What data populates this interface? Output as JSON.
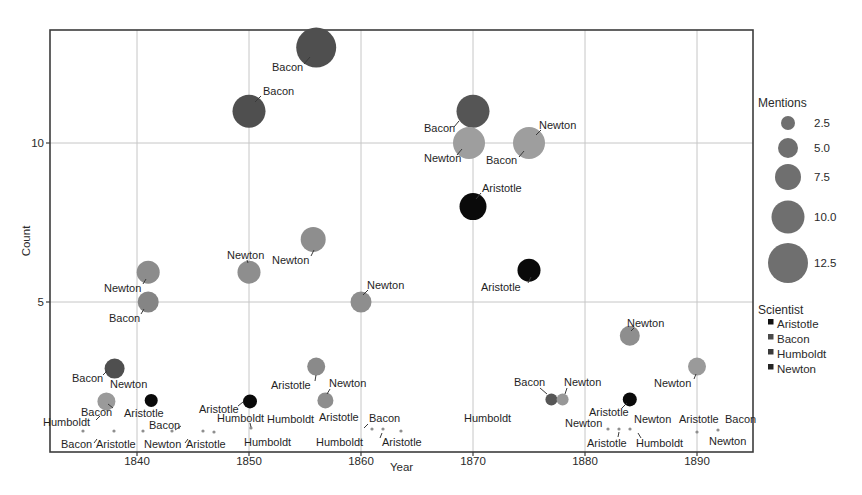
{
  "figure": {
    "width": 862,
    "height": 495,
    "background": "#ffffff"
  },
  "chart_data": {
    "type": "scatter",
    "subtype": "bubble",
    "title": "",
    "xlabel": "Year",
    "ylabel": "Count",
    "x_ticks": [
      1840,
      1850,
      1860,
      1870,
      1880,
      1890
    ],
    "y_ticks": [
      5,
      10
    ],
    "xlim": [
      1832,
      1895
    ],
    "ylim": [
      0.3,
      13.6
    ],
    "grid": true,
    "panel": {
      "left": 50,
      "top": 30,
      "right": 753,
      "bottom": 452,
      "border_color": "#3c3c3c",
      "grid_color": "#c6c6c6",
      "bg": "#ffffff"
    },
    "x_scale": {
      "year0": 1840,
      "x0": 137,
      "px_per_year": 11.2
    },
    "y_scale": {
      "count0": 5,
      "y0": 302,
      "px_per_count": 31.8
    },
    "text_color": "#2a2a2a",
    "leader_color": "#3a3a3a",
    "speck_color": "#8f8f8f",
    "points": [
      {
        "year": 1856,
        "count": 13,
        "mentions": 13,
        "scientist": "Bacon",
        "color": "#4f4f4f",
        "r": 20
      },
      {
        "year": 1850,
        "count": 11,
        "mentions": 11,
        "scientist": "Bacon",
        "color": "#4f4f4f",
        "r": 16.5
      },
      {
        "year": 1870,
        "count": 11,
        "mentions": 11,
        "scientist": "Bacon",
        "color": "#555555",
        "r": 16.5
      },
      {
        "year": 1870,
        "count": 10,
        "mentions": 10,
        "scientist": "Newton",
        "color": "#9e9e9e",
        "r": 16,
        "dx": -4
      },
      {
        "year": 1875,
        "count": 10,
        "mentions": 10,
        "scientist": "Bacon",
        "color": "#9e9e9e",
        "r": 16
      },
      {
        "year": 1870,
        "count": 8,
        "mentions": 8,
        "scientist": "Aristotle",
        "color": "#0a0a0a",
        "r": 13.5
      },
      {
        "year": 1875,
        "count": 6,
        "mentions": 6,
        "scientist": "Aristotle",
        "color": "#0a0a0a",
        "r": 11.5
      },
      {
        "year": 1856,
        "count": 7,
        "mentions": 7,
        "scientist": "Newton",
        "color": "#8e8e8e",
        "r": 12.5,
        "dx": -3,
        "dy": 1
      },
      {
        "year": 1850,
        "count": 6,
        "mentions": 6,
        "scientist": "Newton",
        "color": "#8e8e8e",
        "r": 11.5,
        "dy": 2
      },
      {
        "year": 1841,
        "count": 6,
        "mentions": 6,
        "scientist": "Newton",
        "color": "#8c8c8c",
        "r": 11.5,
        "dy": 2
      },
      {
        "year": 1841,
        "count": 5,
        "mentions": 5,
        "scientist": "Bacon",
        "color": "#858585",
        "r": 10.5
      },
      {
        "year": 1860,
        "count": 5,
        "mentions": 5,
        "scientist": "Newton",
        "color": "#8e8e8e",
        "r": 10.5
      },
      {
        "year": 1884,
        "count": 4,
        "mentions": 4,
        "scientist": "Newton",
        "color": "#8e8e8e",
        "r": 10,
        "dy": 2
      },
      {
        "year": 1890,
        "count": 3,
        "mentions": 3,
        "scientist": "Newton",
        "color": "#9a9a9a",
        "r": 9,
        "dy": 1
      },
      {
        "year": 1856,
        "count": 3,
        "mentions": 3,
        "scientist": "Aristotle",
        "color": "#8a8a8a",
        "r": 9,
        "dy": 1
      },
      {
        "year": 1838,
        "count": 3,
        "mentions": 3,
        "scientist": "Bacon",
        "color": "#4f4f4f",
        "r": 10,
        "dy": 3
      },
      {
        "year": 1837,
        "count": 2,
        "mentions": 2,
        "scientist": "Newton",
        "color": "#9a9a9a",
        "r": 9,
        "dx": 3,
        "dy": 4
      },
      {
        "year": 1857,
        "count": 2,
        "mentions": 2,
        "scientist": "Newton",
        "color": "#8e8e8e",
        "r": 8,
        "dx": -2,
        "dy": 3
      },
      {
        "year": 1841,
        "count": 2,
        "mentions": 2,
        "scientist": "Aristotle",
        "color": "#0a0a0a",
        "r": 6.5,
        "dx": 3,
        "dy": 3
      },
      {
        "year": 1850,
        "count": 2,
        "mentions": 2,
        "scientist": "Aristotle",
        "color": "#0a0a0a",
        "r": 7,
        "dx": 1,
        "dy": 4
      },
      {
        "year": 1877,
        "count": 2,
        "mentions": 2,
        "scientist": "Bacon",
        "color": "#565656",
        "r": 6,
        "dy": 2
      },
      {
        "year": 1878,
        "count": 2,
        "mentions": 2,
        "scientist": "Newton",
        "color": "#989898",
        "r": 6,
        "dy": 2
      },
      {
        "year": 1884,
        "count": 2,
        "mentions": 2,
        "scientist": "Aristotle",
        "color": "#0a0a0a",
        "r": 7,
        "dy": 2
      }
    ],
    "specks": [
      {
        "x": 83,
        "y": 431
      },
      {
        "x": 114,
        "y": 431
      },
      {
        "x": 143,
        "y": 431
      },
      {
        "x": 172,
        "y": 431
      },
      {
        "x": 203,
        "y": 431
      },
      {
        "x": 214,
        "y": 432
      },
      {
        "x": 251,
        "y": 428
      },
      {
        "x": 372,
        "y": 429
      },
      {
        "x": 383,
        "y": 429
      },
      {
        "x": 401,
        "y": 431
      },
      {
        "x": 608,
        "y": 429
      },
      {
        "x": 619,
        "y": 429
      },
      {
        "x": 630,
        "y": 429
      },
      {
        "x": 697,
        "y": 432
      },
      {
        "x": 718,
        "y": 430
      }
    ],
    "labels": [
      {
        "text": "Bacon",
        "x": 272,
        "y": 71,
        "leader": [
          304,
          64,
          310,
          57
        ]
      },
      {
        "text": "Bacon",
        "x": 263,
        "y": 95,
        "leader": [
          261,
          96,
          255,
          102
        ]
      },
      {
        "text": "Bacon",
        "x": 424,
        "y": 132,
        "leader": [
          454,
          127,
          459,
          121
        ]
      },
      {
        "text": "Newton",
        "x": 424,
        "y": 162,
        "leader": [
          457,
          155,
          462,
          149
        ]
      },
      {
        "text": "Newton",
        "x": 539,
        "y": 129,
        "leader": [
          541,
          130,
          536,
          135
        ]
      },
      {
        "text": "Bacon",
        "x": 486,
        "y": 164,
        "leader": [
          519,
          157,
          524,
          151
        ]
      },
      {
        "text": "Aristotle",
        "x": 482,
        "y": 192,
        "leader": [
          481,
          193,
          476,
          199
        ]
      },
      {
        "text": "Aristotle",
        "x": 481,
        "y": 291,
        "leader": [
          528,
          283,
          531,
          277
        ]
      },
      {
        "text": "Newton",
        "x": 272,
        "y": 264,
        "leader": [
          311,
          256,
          314,
          250
        ]
      },
      {
        "text": "Newton",
        "x": 227,
        "y": 259,
        "leader": [
          247,
          260,
          248,
          263
        ]
      },
      {
        "text": "Newton",
        "x": 104,
        "y": 292,
        "leader": [
          143,
          284,
          146,
          279
        ]
      },
      {
        "text": "Bacon",
        "x": 109,
        "y": 322,
        "leader": [
          141,
          314,
          144,
          309
        ]
      },
      {
        "text": "Newton",
        "x": 367,
        "y": 289,
        "leader": [
          368,
          290,
          363,
          295
        ]
      },
      {
        "text": "Newton",
        "x": 627,
        "y": 327,
        "leader": [
          634,
          328,
          631,
          331
        ]
      },
      {
        "text": "Newton",
        "x": 654,
        "y": 387,
        "leader": [
          694,
          379,
          696,
          374
        ]
      },
      {
        "text": "Aristotle",
        "x": 271,
        "y": 389,
        "leader": [
          315,
          381,
          316,
          375
        ]
      },
      {
        "text": "Newton",
        "x": 329,
        "y": 387,
        "leader": [
          330,
          389,
          327,
          394
        ]
      },
      {
        "text": "Bacon",
        "x": 72,
        "y": 382,
        "leader": [
          103,
          375,
          107,
          371
        ]
      },
      {
        "text": "Newton",
        "x": 110,
        "y": 388
      },
      {
        "text": "Bacon",
        "x": 81,
        "y": 416,
        "leader": [
          113,
          408,
          108,
          404
        ]
      },
      {
        "text": "Aristotle",
        "x": 124,
        "y": 417
      },
      {
        "text": "Humboldt",
        "x": 43,
        "y": 426,
        "leader": [
          96,
          420,
          100,
          416
        ]
      },
      {
        "text": "Bacon",
        "x": 149,
        "y": 429,
        "leader": [
          181,
          426,
          175,
          430
        ]
      },
      {
        "text": "Aristotle",
        "x": 199,
        "y": 413,
        "leader": [
          238,
          406,
          243,
          402
        ]
      },
      {
        "text": "Humboldt",
        "x": 217,
        "y": 422,
        "leader": [
          250,
          423,
          251,
          427
        ]
      },
      {
        "text": "Humboldt",
        "x": 267,
        "y": 423
      },
      {
        "text": "Bacon",
        "x": 61,
        "y": 448,
        "leader": [
          94,
          443,
          97,
          439
        ]
      },
      {
        "text": "Aristotle",
        "x": 96,
        "y": 448
      },
      {
        "text": "Newton",
        "x": 144,
        "y": 448,
        "leader": [
          185,
          443,
          188,
          439
        ]
      },
      {
        "text": "Aristotle",
        "x": 186,
        "y": 448
      },
      {
        "text": "Humboldt",
        "x": 244,
        "y": 446
      },
      {
        "text": "Humboldt",
        "x": 316,
        "y": 446
      },
      {
        "text": "Aristotle",
        "x": 382,
        "y": 446,
        "leader": [
          380,
          438,
          382,
          433
        ]
      },
      {
        "text": "Aristotle",
        "x": 319,
        "y": 421
      },
      {
        "text": "Bacon",
        "x": 369,
        "y": 422,
        "leader": [
          368,
          424,
          364,
          428
        ]
      },
      {
        "text": "Humboldt",
        "x": 464,
        "y": 422
      },
      {
        "text": "Bacon",
        "x": 514,
        "y": 386,
        "leader": [
          540,
          388,
          547,
          394
        ]
      },
      {
        "text": "Newton",
        "x": 564,
        "y": 386,
        "leader": [
          567,
          388,
          565,
          394
        ]
      },
      {
        "text": "Aristotle",
        "x": 589,
        "y": 416,
        "leader": [
          622,
          408,
          627,
          403
        ]
      },
      {
        "text": "Newton",
        "x": 565,
        "y": 427
      },
      {
        "text": "Newton",
        "x": 634,
        "y": 423
      },
      {
        "text": "Aristotle",
        "x": 679,
        "y": 423
      },
      {
        "text": "Bacon",
        "x": 725,
        "y": 423
      },
      {
        "text": "Aristotle",
        "x": 587,
        "y": 447,
        "leader": [
          618,
          437,
          619,
          432
        ]
      },
      {
        "text": "Humboldt",
        "x": 636,
        "y": 447,
        "leader": [
          641,
          438,
          638,
          433
        ]
      },
      {
        "text": "Newton",
        "x": 709,
        "y": 445
      }
    ]
  },
  "legend": {
    "size": {
      "title": "Mentions",
      "bubble_color": "#6f6f6f",
      "items": [
        {
          "label": "2.5",
          "r": 7
        },
        {
          "label": "5.0",
          "r": 10
        },
        {
          "label": "7.5",
          "r": 13
        },
        {
          "label": "10.0",
          "r": 16.5
        },
        {
          "label": "12.5",
          "r": 20
        }
      ]
    },
    "color": {
      "title": "Scientist",
      "items": [
        {
          "label": "Aristotle",
          "color": "#111111"
        },
        {
          "label": "Bacon",
          "color": "#4a4a4a"
        },
        {
          "label": "Humboldt",
          "color": "#3a3a3a"
        },
        {
          "label": "Newton",
          "color": "#242424"
        }
      ]
    }
  }
}
